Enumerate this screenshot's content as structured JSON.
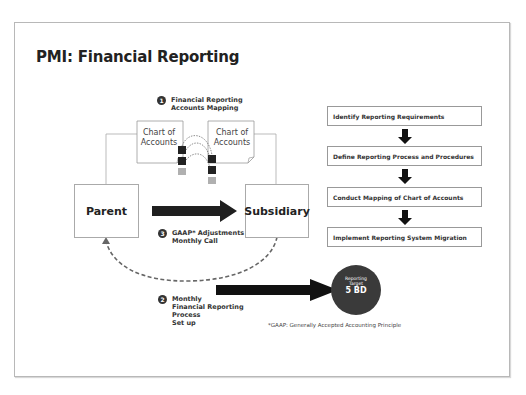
{
  "title": "PMI: Financial Reporting",
  "step1": {
    "number": "1",
    "line1": "Financial Reporting",
    "line2": "Accounts Mapping"
  },
  "chart_of_accounts": {
    "left": {
      "line1": "Chart of",
      "line2": "Accounts"
    },
    "right": {
      "line1": "Chart of",
      "line2": "Accounts"
    }
  },
  "entities": {
    "parent": "Parent",
    "subsidiary": "Subsidiary"
  },
  "step3": {
    "number": "3",
    "line1": "GAAP* Adjustments",
    "line2": "Monthly Call"
  },
  "step2": {
    "number": "2",
    "lines": [
      "Monthly",
      "Financial Reporting",
      "Process",
      "Set up"
    ]
  },
  "target": {
    "line1": "Reporting",
    "line2": "Target",
    "value": "5 BD"
  },
  "footnote": "*GAAP: Generally Accepted Accounting Principle",
  "process_steps": [
    "Identify Reporting Requirements",
    "Define Reporting Process and Procedures",
    "Conduct Mapping of Chart of Accounts",
    "Implement Reporting System Migration"
  ],
  "colors": {
    "dark": "#1a1a1a",
    "circle": "#3a3a3a",
    "gray_square": "#b0b0b0",
    "border": "#aaaaaa"
  }
}
